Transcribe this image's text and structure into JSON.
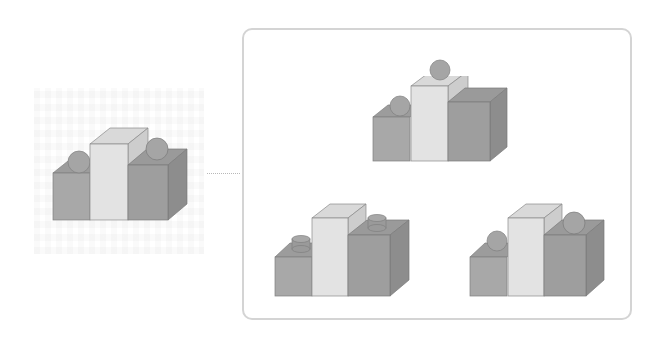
{
  "diagram": {
    "type": "spatial-reasoning-puzzle",
    "reference": {
      "label": "",
      "blocks": [
        "left-low-cube",
        "center-tall-prism",
        "right-cube"
      ],
      "objects": [
        {
          "shape": "sphere",
          "position": "left-cube-top-back"
        },
        {
          "shape": "sphere",
          "position": "right-cube-top-back"
        }
      ]
    },
    "options": [
      {
        "position": "top",
        "objects": [
          {
            "shape": "sphere",
            "position": "left-cube-top-back"
          },
          {
            "shape": "sphere",
            "position": "center-prism-top"
          }
        ]
      },
      {
        "position": "bottom-left",
        "objects": [
          {
            "shape": "cylinder",
            "position": "left-cube-top"
          },
          {
            "shape": "cylinder",
            "position": "right-cube-top"
          }
        ]
      },
      {
        "position": "bottom-right",
        "objects": [
          {
            "shape": "sphere",
            "position": "left-cube-top-back"
          },
          {
            "shape": "sphere",
            "position": "right-cube-top-back"
          }
        ]
      }
    ],
    "colors": {
      "box_border": "#d4d4d4",
      "connector": "#b8b8b8",
      "cube_front": "#a9a9a9",
      "cube_top": "#9a9a9a",
      "cube_side": "#8f8f8f",
      "prism_front": "#e2e2e2",
      "prism_top": "#d8d8d8",
      "prism_side": "#cfcfcf",
      "right_front": "#9b9b9b",
      "sphere": "#a6a6a6",
      "edge": "#7a7a7a"
    }
  }
}
